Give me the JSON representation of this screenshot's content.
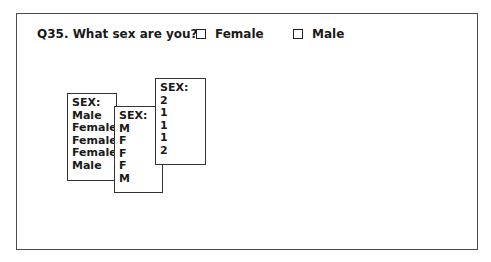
{
  "question": {
    "label": "Q35. What sex are you?",
    "options": [
      {
        "label": "Female",
        "checked": false,
        "icon": "checkbox-empty-icon"
      },
      {
        "label": "Male",
        "checked": false,
        "icon": "checkbox-empty-icon"
      }
    ]
  },
  "cards": [
    {
      "header": "SEX:",
      "values": [
        "Male",
        "Female",
        "Female",
        "Female",
        "Male"
      ]
    },
    {
      "header": "SEX:",
      "values": [
        "M",
        "F",
        "F",
        "F",
        "M"
      ]
    },
    {
      "header": "SEX:",
      "values": [
        "2",
        "1",
        "1",
        "1",
        "2"
      ]
    }
  ]
}
